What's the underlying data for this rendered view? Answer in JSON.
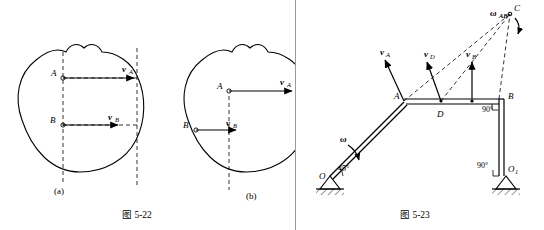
{
  "figures": [
    {
      "id": "fig-5-22",
      "caption": "图 5-22",
      "subfigures": [
        {
          "id": "a",
          "label": "(a)",
          "points": [
            "A",
            "B"
          ],
          "vectors": [
            "vA",
            "vB"
          ]
        },
        {
          "id": "b",
          "label": "(b)",
          "points": [
            "A",
            "B"
          ],
          "vectors": [
            "vA",
            "vB"
          ]
        }
      ],
      "labels": {
        "point_a": "A",
        "point_b": "B",
        "vel_a": "v",
        "vel_a_sub": "A",
        "vel_b": "v",
        "vel_b_sub": "B"
      }
    },
    {
      "id": "fig-5-23",
      "caption": "图 5-23",
      "labels": {
        "point_a": "A",
        "point_b": "B",
        "point_c": "C",
        "point_d": "D",
        "point_o": "O",
        "point_o1": "O",
        "point_o1_sub": "1",
        "omega": "ω",
        "omega_ab": "ω",
        "omega_ab_sub": "AB",
        "vel_a": "v",
        "vel_a_sub": "A",
        "vel_d": "v",
        "vel_d_sub": "D",
        "vel_b": "v",
        "vel_b_sub": "B",
        "angle_45": "45°",
        "angle_90_d": "90°",
        "angle_90_o1": "90°"
      }
    }
  ]
}
